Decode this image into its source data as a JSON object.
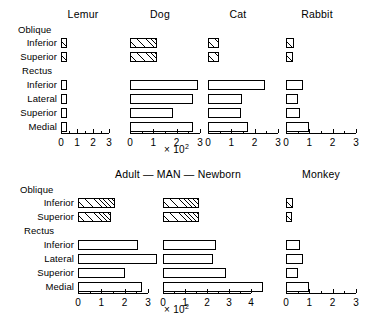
{
  "figure": {
    "axis_exponent_label": "× 10",
    "axis_exponent_sup": "2",
    "group_labels": {
      "oblique": "Oblique",
      "rectus": "Rectus"
    },
    "categories": [
      {
        "key": "oblique_inferior",
        "label": "Inferior",
        "group": "oblique",
        "fill": "hatch"
      },
      {
        "key": "oblique_superior",
        "label": "Superior",
        "group": "oblique",
        "fill": "hatch"
      },
      {
        "key": "rectus_inferior",
        "label": "Inferior",
        "group": "rectus",
        "fill": "plain"
      },
      {
        "key": "rectus_lateral",
        "label": "Lateral",
        "group": "rectus",
        "fill": "plain"
      },
      {
        "key": "rectus_superior",
        "label": "Superior",
        "group": "rectus",
        "fill": "plain"
      },
      {
        "key": "rectus_medial",
        "label": "Medial",
        "group": "rectus",
        "fill": "plain"
      }
    ]
  },
  "chart_data": {
    "type": "bar",
    "title": "",
    "xlabel": "× 10²",
    "ylabel": "",
    "orientation": "horizontal",
    "grid": false,
    "legend": "none",
    "categories": [
      "Oblique Inferior",
      "Oblique Superior",
      "Rectus Inferior",
      "Rectus Lateral",
      "Rectus Superior",
      "Rectus Medial"
    ],
    "row1_title_group": "",
    "row2_title_group": "Adult — MAN — Newborn",
    "panels": [
      {
        "name": "Lemur",
        "title": "Lemur",
        "row": 1,
        "xlim": [
          0,
          3
        ],
        "xticks": [
          0,
          1,
          2,
          3
        ],
        "xticklabels": [
          "0",
          "1",
          "2",
          "3"
        ],
        "values": [
          0.18,
          0.15,
          0.3,
          0.3,
          0.12,
          0.3
        ]
      },
      {
        "name": "Dog",
        "title": "Dog",
        "row": 1,
        "xlim": [
          0,
          3
        ],
        "xticks": [
          0,
          1,
          2,
          3
        ],
        "xticklabels": [
          "0",
          "1",
          "2",
          "3"
        ],
        "values": [
          1.15,
          1.15,
          2.9,
          2.7,
          1.85,
          2.7
        ]
      },
      {
        "name": "Cat",
        "title": "Cat",
        "row": 1,
        "xlim": [
          0,
          3
        ],
        "xticks": [
          0,
          1,
          2,
          3
        ],
        "xticklabels": [
          "0",
          "1",
          "2",
          "3"
        ],
        "values": [
          0.48,
          0.48,
          2.45,
          1.45,
          1.4,
          1.7
        ]
      },
      {
        "name": "Rabbit",
        "title": "Rabbit",
        "row": 1,
        "xlim": [
          0,
          3
        ],
        "xticks": [
          0,
          1,
          2,
          3
        ],
        "xticklabels": [
          "0",
          "1",
          "2",
          "3"
        ],
        "values": [
          0.35,
          0.32,
          0.72,
          0.52,
          0.58,
          1.0
        ]
      },
      {
        "name": "Adult",
        "title": "Adult",
        "row": 2,
        "xlim": [
          0,
          3
        ],
        "xticks": [
          0,
          1,
          2,
          3
        ],
        "xticklabels": [
          "0",
          "1",
          "2",
          "3"
        ],
        "values": [
          1.6,
          1.4,
          2.55,
          3.4,
          2.0,
          2.75
        ]
      },
      {
        "name": "Newborn",
        "title": "Newborn",
        "row": 2,
        "xlim": [
          0,
          4
        ],
        "xticks": [
          0,
          1,
          2,
          3,
          4
        ],
        "xticklabels": [
          "0",
          "1",
          "2",
          "3",
          "4"
        ],
        "values": [
          1.65,
          1.65,
          2.4,
          2.25,
          2.85,
          4.55
        ]
      },
      {
        "name": "Monkey",
        "title": "Monkey",
        "row": 2,
        "xlim": [
          0,
          3
        ],
        "xticks": [
          0,
          1,
          2,
          3
        ],
        "xticklabels": [
          "0",
          "1",
          "2",
          "3"
        ],
        "values": [
          0.28,
          0.25,
          0.62,
          0.72,
          0.5,
          1.0
        ]
      }
    ]
  }
}
